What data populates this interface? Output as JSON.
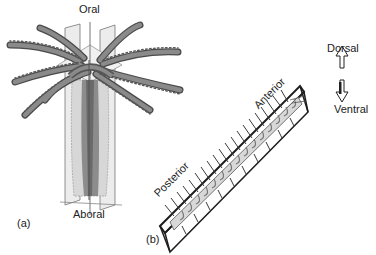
{
  "figure": {
    "panel_a": {
      "label": "(a)",
      "top_label": "Oral",
      "bottom_label": "Aboral"
    },
    "panel_b": {
      "label": "(b)",
      "axis_labels": {
        "posterior": "Posterior",
        "anterior": "Anterior",
        "dorsal": "Dorsal",
        "ventral": "Ventral"
      }
    },
    "colors": {
      "tentacle": "#7a7a7a",
      "tentacle_edge": "#4a4a4a",
      "plane": "#e4e4e4",
      "body_dark": "#8a8a8a",
      "body_light": "#cfcfcf",
      "frame": "#1e1e1e"
    }
  }
}
